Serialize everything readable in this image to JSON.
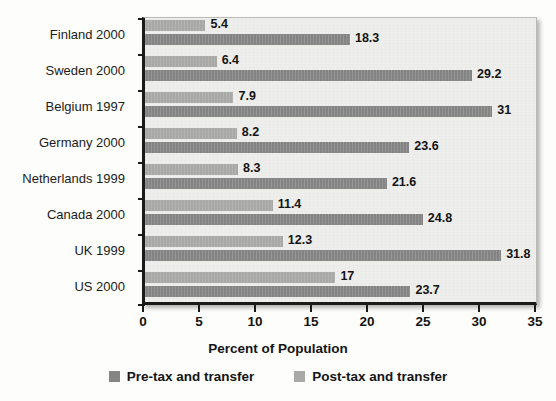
{
  "chart_data": {
    "type": "bar",
    "orientation": "horizontal",
    "title": "",
    "xlabel": "Percent of Population",
    "ylabel": "",
    "xlim": [
      0,
      35
    ],
    "xticks": [
      0,
      5,
      10,
      15,
      20,
      25,
      30,
      35
    ],
    "xtick_labels": [
      "0",
      "5",
      "10",
      "15",
      "20",
      "25",
      "30",
      "35"
    ],
    "grid": false,
    "legend_position": "bottom",
    "categories": [
      "Finland 2000",
      "Sweden 2000",
      "Belgium 1997",
      "Germany 2000",
      "Netherlands 1999",
      "Canada 2000",
      "UK 1999",
      "US 2000"
    ],
    "series": [
      {
        "name": "Post-tax and transfer",
        "color": "#a9a9a7",
        "values": [
          5.4,
          6.4,
          7.9,
          8.2,
          8.3,
          11.4,
          12.3,
          17
        ],
        "value_labels": [
          "5.4",
          "6.4",
          "7.9",
          "8.2",
          "8.3",
          "11.4",
          "12.3",
          "17"
        ]
      },
      {
        "name": "Pre-tax and transfer",
        "color": "#858585",
        "values": [
          18.3,
          29.2,
          31,
          23.6,
          21.6,
          24.8,
          31.8,
          23.7
        ],
        "value_labels": [
          "18.3",
          "29.2",
          "31",
          "23.6",
          "21.6",
          "24.8",
          "31.8",
          "23.7"
        ]
      }
    ]
  },
  "legend": {
    "items": [
      {
        "label": "Pre-tax and transfer",
        "swatch": "pre"
      },
      {
        "label": "Post-tax and transfer",
        "swatch": "post"
      }
    ]
  },
  "axis": {
    "x_title": "Percent of Population"
  },
  "colors": {
    "pre_tax_bar": "#858585",
    "post_tax_bar": "#a9a9a7",
    "plot_background": "#eeeeec",
    "axis_line": "#1a1a1a",
    "text": "#141414"
  }
}
